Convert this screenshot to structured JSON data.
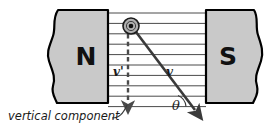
{
  "diagram": {
    "canvas": {
      "width": 268,
      "height": 129,
      "background": "#ffffff"
    },
    "magnets": [
      {
        "id": "north-pole",
        "label": "N",
        "side": "left",
        "fill": "#c9c9c9",
        "stroke": "#000000",
        "x": 48,
        "y": 10,
        "width": 60,
        "height": 93,
        "wavy_edge": "left"
      },
      {
        "id": "south-pole",
        "label": "S",
        "side": "right",
        "fill": "#c9c9c9",
        "stroke": "#000000",
        "x": 206,
        "y": 10,
        "width": 56,
        "height": 93,
        "wavy_edge": "right"
      }
    ],
    "field": {
      "name": "magnetic-field-lines",
      "line_count": 10,
      "color": "#4a4a4a",
      "x_start": 108,
      "x_end": 206,
      "y_first": 13,
      "y_spacing": 10.4,
      "direction": "left-to-right (N to S)"
    },
    "particle": {
      "name": "charge-out-of-page",
      "cx": 131,
      "cy": 26,
      "outer_radius": 8,
      "dot_radius": 2.4,
      "ring_fill": "#b0b0b0",
      "stroke": "#1a1a1a",
      "meaning": "velocity/current directed out of the page"
    },
    "vectors": [
      {
        "id": "velocity-vector",
        "label": "v",
        "label_x": 167,
        "label_y": 75,
        "from_x": 136,
        "from_y": 32,
        "to_x": 197,
        "to_y": 112,
        "style": "solid",
        "color": "#3a3a3a",
        "width": 2.6
      },
      {
        "id": "vertical-component-vector",
        "label": "v'",
        "label_x": 113,
        "label_y": 75,
        "from_x": 128,
        "from_y": 34,
        "to_x": 128,
        "to_y": 106,
        "style": "dashed",
        "color": "#4a4a4a",
        "width": 2.4
      }
    ],
    "angle": {
      "id": "theta-angle",
      "symbol": "θ",
      "label_x": 173,
      "label_y": 110,
      "arc_cx": 186,
      "arc_cy": 107,
      "arc_radius": 13,
      "between": [
        "horizontal field line",
        "velocity vector v"
      ]
    },
    "caption": {
      "id": "vertical-component-caption",
      "text": "vertical component",
      "x": 8,
      "y": 120,
      "leader_from_x": 113,
      "leader_from_y": 117,
      "leader_to_x": 128,
      "leader_to_y": 104
    }
  }
}
